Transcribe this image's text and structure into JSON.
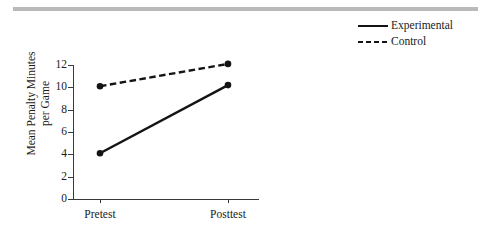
{
  "figure": {
    "top_rule_color": "#b9b9b9",
    "background_color": "#ffffff",
    "line_color": "#141414"
  },
  "legend": {
    "position": "top-right",
    "entries": [
      {
        "label": "Experimental",
        "style": "solid",
        "swatch": "solid-line-swatch"
      },
      {
        "label": "Control",
        "style": "dashed",
        "swatch": "dashed-line-swatch"
      }
    ]
  },
  "axes": {
    "ylabel": "Mean Penalty Minutes per Game",
    "ylabel_line1": "Mean Penalty Minutes",
    "ylabel_line2": "per Game",
    "xlabel": "",
    "ytick_labels": [
      "0",
      "2",
      "4",
      "6",
      "8",
      "10",
      "12"
    ],
    "xtick_labels": [
      "Pretest",
      "Posttest"
    ]
  },
  "chart_data": {
    "type": "line",
    "title": "",
    "subtitle": "",
    "xlabel": "",
    "ylabel": "Mean Penalty Minutes per Game",
    "categories": [
      "Pretest",
      "Posttest"
    ],
    "series": [
      {
        "name": "Experimental",
        "style": "solid",
        "marker": "circle",
        "values": [
          4.1,
          10.2
        ]
      },
      {
        "name": "Control",
        "style": "dashed",
        "marker": "circle",
        "values": [
          10.1,
          12.1
        ]
      }
    ],
    "ylim": [
      0,
      12.6
    ],
    "yticks": [
      0,
      2,
      4,
      6,
      8,
      10,
      12
    ],
    "grid": false,
    "legend_position": "top-right"
  }
}
